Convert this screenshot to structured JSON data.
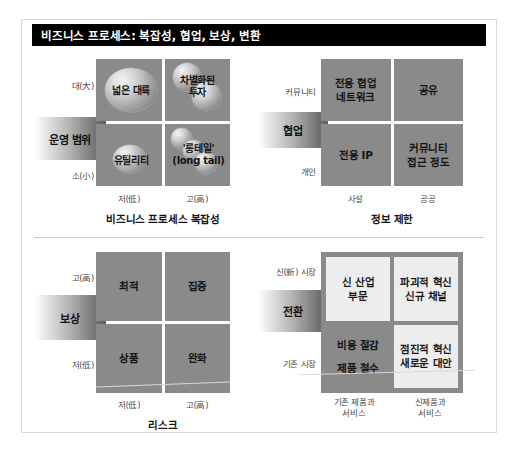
{
  "header": {
    "title": "비즈니스 프로세스: 복잡성, 협업, 보상, 변환"
  },
  "quadrants": {
    "top_left": {
      "caption": "비즈니스 프로세스 복잡성",
      "y_axis_label": "운영 범위",
      "y_ticks": [
        "대(大)",
        "소(小)"
      ],
      "x_ticks": [
        "저(低)",
        "고(高)"
      ],
      "bubbles": [
        {
          "label": "넓은 대륙",
          "cell": "top-left"
        },
        {
          "label": "차별화된\n투자",
          "cell": "top-right"
        },
        {
          "label": "유틸리티",
          "cell": "bottom-left"
        },
        {
          "label": "'롱테일'\n(long tail)",
          "cell": "bottom-right"
        }
      ],
      "bubble_labels": {
        "tl": "넓은 대륙",
        "tr_1": "차별화된",
        "tr_2": "투자",
        "bl": "유틸리티",
        "br_1": "'롱테일'",
        "br_2": "(long tail)"
      }
    },
    "top_right": {
      "caption": "정보 제한",
      "y_axis_label": "협업",
      "y_ticks": [
        "커뮤니티",
        "개인"
      ],
      "x_ticks": [
        "사설",
        "공공"
      ],
      "cells": [
        {
          "line1": "전용 협업",
          "line2": "네트워크"
        },
        {
          "line1": "공유",
          "line2": ""
        },
        {
          "line1": "전용 IP",
          "line2": ""
        },
        {
          "line1": "커뮤니티",
          "line2": "접근 정도"
        }
      ]
    },
    "bottom_left": {
      "caption": "리스크",
      "y_axis_label": "보상",
      "y_ticks": [
        "고(高)",
        "저(低)"
      ],
      "x_ticks": [
        "저(低)",
        "고(高)"
      ],
      "cells": [
        {
          "line1": "최적",
          "line2": ""
        },
        {
          "line1": "집중",
          "line2": ""
        },
        {
          "line1": "상품",
          "line2": ""
        },
        {
          "line1": "완화",
          "line2": ""
        }
      ]
    },
    "bottom_right": {
      "caption": "",
      "y_axis_label": "전환",
      "y_ticks": [
        "신(新) 시장",
        "기존 시장"
      ],
      "x_ticks_line1": [
        "기존 제품과",
        "신제품과"
      ],
      "x_ticks_line2": [
        "서비스",
        "서비스"
      ],
      "cells": [
        {
          "line1": "신 산업",
          "line2": "부문",
          "style": "light"
        },
        {
          "line1": "파괴적 혁신",
          "line2": "신규 채널",
          "style": "light"
        },
        {
          "line1": "비용 절감",
          "line2": "제품 철수",
          "style": "dark"
        },
        {
          "line1": "점진적 혁신",
          "line2": "새로운 대안",
          "style": "light"
        }
      ]
    }
  },
  "colors": {
    "titlebar_bg": "#000000",
    "titlebar_text": "#ffffff",
    "cell_dark": "#8a8a8a",
    "cell_light": "#ededed",
    "frame_border": "#d9d9d9",
    "divider": "#c9c9c9"
  }
}
